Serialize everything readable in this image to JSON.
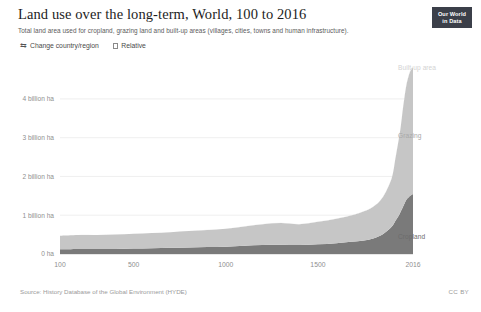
{
  "header": {
    "title": "Land use over the long-term, World, 100 to 2016",
    "subtitle": "Total land area used for cropland, grazing land and built-up areas (villages, cities, towns and human infrastructure)."
  },
  "logo": {
    "line1": "Our World",
    "line2": "in Data"
  },
  "controls": {
    "change_region_label": "Change country/region",
    "change_region_icon": "swap-arrows-icon",
    "relative_label": "Relative",
    "relative_checked": false
  },
  "footer": {
    "source": "Source: History Database of the Global Environment (HYDE)",
    "license": "CC BY"
  },
  "colors": {
    "cropland": "#7a7a7a",
    "grazing": "#c6c6c6",
    "builtup": "#ebebeb",
    "gridline": "#e8e8e8",
    "axis_text": "#8f8f8f",
    "title": "#1d1d1d",
    "subtitle": "#5b5b5b",
    "logo_background": "#3b3f49"
  },
  "chart_data": {
    "type": "area",
    "stacked": true,
    "title": "Land use over the long-term, World, 100 to 2016",
    "subtitle": "Total land area used for cropland, grazing land and built-up areas (villages, cities, towns and human infrastructure).",
    "xlabel": "",
    "ylabel": "",
    "unit": "billion hectares",
    "grid": true,
    "legend_position": "inline-right",
    "xlim": [
      100,
      2016
    ],
    "ylim": [
      0,
      4.9
    ],
    "x_ticks": [
      100,
      500,
      1000,
      1500,
      2016
    ],
    "x_tick_labels": [
      "100",
      "500",
      "1000",
      "1500",
      "2016"
    ],
    "y_ticks": [
      0,
      1,
      2,
      3,
      4
    ],
    "y_tick_labels": [
      "0 ha",
      "1 billion ha",
      "2 billion ha",
      "3 billion ha",
      "4 billion ha"
    ],
    "x": [
      100,
      200,
      300,
      400,
      500,
      600,
      700,
      800,
      900,
      1000,
      1100,
      1200,
      1300,
      1400,
      1500,
      1600,
      1700,
      1750,
      1800,
      1850,
      1900,
      1920,
      1940,
      1950,
      1960,
      1970,
      1980,
      1990,
      2000,
      2010,
      2016
    ],
    "series": [
      {
        "name": "Cropland",
        "color": "#7a7a7a",
        "values": [
          0.12,
          0.13,
          0.13,
          0.13,
          0.14,
          0.15,
          0.16,
          0.17,
          0.18,
          0.19,
          0.21,
          0.23,
          0.24,
          0.23,
          0.25,
          0.28,
          0.32,
          0.35,
          0.4,
          0.5,
          0.7,
          0.85,
          1.0,
          1.1,
          1.2,
          1.3,
          1.4,
          1.45,
          1.5,
          1.53,
          1.55
        ]
      },
      {
        "name": "Grazing",
        "color": "#c6c6c6",
        "values": [
          0.35,
          0.36,
          0.36,
          0.37,
          0.38,
          0.39,
          0.4,
          0.42,
          0.44,
          0.46,
          0.5,
          0.54,
          0.56,
          0.54,
          0.58,
          0.63,
          0.7,
          0.75,
          0.82,
          0.95,
          1.25,
          1.6,
          2.0,
          2.2,
          2.5,
          2.75,
          2.95,
          3.1,
          3.2,
          3.25,
          3.27
        ]
      },
      {
        "name": "Built-up area",
        "color": "#ebebeb",
        "values": [
          0.002,
          0.002,
          0.002,
          0.002,
          0.003,
          0.003,
          0.003,
          0.003,
          0.004,
          0.004,
          0.004,
          0.005,
          0.005,
          0.005,
          0.005,
          0.006,
          0.006,
          0.007,
          0.008,
          0.009,
          0.011,
          0.012,
          0.014,
          0.015,
          0.017,
          0.019,
          0.021,
          0.023,
          0.025,
          0.027,
          0.028
        ]
      }
    ],
    "annotations": [
      {
        "text": "Built-up area",
        "series": "Built-up area"
      },
      {
        "text": "Grazing",
        "series": "Grazing"
      },
      {
        "text": "Cropland",
        "series": "Cropland"
      }
    ]
  }
}
